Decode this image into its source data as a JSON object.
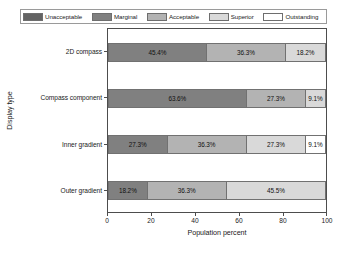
{
  "chart_data": {
    "type": "bar",
    "orientation": "horizontal",
    "stacked": true,
    "title": "",
    "xlabel": "Population percent",
    "ylabel": "Display type",
    "xlim": [
      0,
      100
    ],
    "xticks": [
      0,
      20,
      40,
      60,
      80,
      100
    ],
    "xtick_labels": [
      "0",
      "20",
      "40",
      "60",
      "80",
      "100"
    ],
    "grid": false,
    "legend_position": "top",
    "categories": [
      "2D compass",
      "Compass component",
      "Inner gradient",
      "Outer gradient"
    ],
    "series": [
      {
        "name": "Unacceptable",
        "color": "#636363",
        "values": [
          0,
          0,
          0,
          0
        ]
      },
      {
        "name": "Marginal",
        "color": "#808080",
        "values": [
          45.4,
          63.6,
          27.3,
          18.2
        ]
      },
      {
        "name": "Acceptable",
        "color": "#b3b3b3",
        "values": [
          36.3,
          27.3,
          36.3,
          36.3
        ]
      },
      {
        "name": "Superior",
        "color": "#d9d9d9",
        "values": [
          18.2,
          9.1,
          27.3,
          45.5
        ]
      },
      {
        "name": "Outstanding",
        "color": "#ffffff",
        "values": [
          0,
          0,
          9.1,
          0
        ]
      }
    ],
    "bars": [
      {
        "category": "2D compass",
        "segments": [
          {
            "series": "Marginal",
            "value": 45.4,
            "label": "45.4%",
            "color": "#808080"
          },
          {
            "series": "Acceptable",
            "value": 36.3,
            "label": "36.3%",
            "color": "#b3b3b3"
          },
          {
            "series": "Superior",
            "value": 18.2,
            "label": "18.2%",
            "color": "#d9d9d9"
          }
        ]
      },
      {
        "category": "Compass component",
        "segments": [
          {
            "series": "Marginal",
            "value": 63.6,
            "label": "63.6%",
            "color": "#808080"
          },
          {
            "series": "Acceptable",
            "value": 27.3,
            "label": "27.3%",
            "color": "#b3b3b3"
          },
          {
            "series": "Superior",
            "value": 9.1,
            "label": "9.1%",
            "color": "#d9d9d9"
          }
        ]
      },
      {
        "category": "Inner gradient",
        "segments": [
          {
            "series": "Marginal",
            "value": 27.3,
            "label": "27.3%",
            "color": "#808080"
          },
          {
            "series": "Acceptable",
            "value": 36.3,
            "label": "36.3%",
            "color": "#b3b3b3"
          },
          {
            "series": "Superior",
            "value": 27.3,
            "label": "27.3%",
            "color": "#d9d9d9"
          },
          {
            "series": "Outstanding",
            "value": 9.1,
            "label": "9.1%",
            "color": "#ffffff"
          }
        ]
      },
      {
        "category": "Outer gradient",
        "segments": [
          {
            "series": "Marginal",
            "value": 18.2,
            "label": "18.2%",
            "color": "#808080"
          },
          {
            "series": "Acceptable",
            "value": 36.3,
            "label": "36.3%",
            "color": "#b3b3b3"
          },
          {
            "series": "Superior",
            "value": 45.5,
            "label": "45.5%",
            "color": "#d9d9d9"
          }
        ]
      }
    ]
  },
  "legend": {
    "items": [
      {
        "label": "Unacceptable",
        "color": "#636363"
      },
      {
        "label": "Marginal",
        "color": "#808080"
      },
      {
        "label": "Acceptable",
        "color": "#b3b3b3"
      },
      {
        "label": "Superior",
        "color": "#d9d9d9"
      },
      {
        "label": "Outstanding",
        "color": "#ffffff"
      }
    ]
  }
}
